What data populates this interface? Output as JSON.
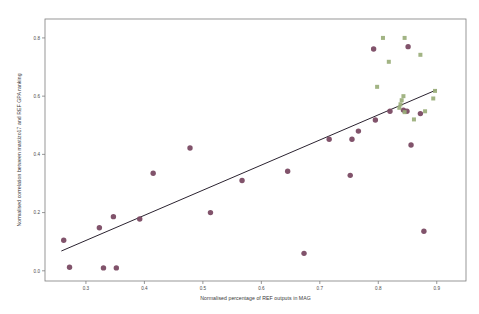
{
  "chart_data": {
    "type": "scatter",
    "title": "",
    "xlabel": "Normalised percentage of REF outputs in MAG",
    "ylabel": "Normalised correlation between mastizo17 and REF GPA ranking",
    "xlim": [
      0.23,
      0.95
    ],
    "ylim": [
      -0.035,
      0.865
    ],
    "xticks": [
      0.3,
      0.4,
      0.5,
      0.6,
      0.7,
      0.8,
      0.9
    ],
    "xtick_labels": [
      "0.3",
      "0.4",
      "0.5",
      "0.6",
      "0.7",
      "0.8",
      "0.9"
    ],
    "yticks": [
      0.0,
      0.2,
      0.4,
      0.6,
      0.8
    ],
    "ytick_labels": [
      "0.0",
      "0.2",
      "0.4",
      "0.6",
      "0.8"
    ],
    "grid": false,
    "legend_position": "none",
    "colors": {
      "series_primary": "#7a4a63",
      "series_secondary": "#9aae7a",
      "fit_line": "#2b2330",
      "axis": "#7d7d7d",
      "text": "#3a3a3a",
      "background": "#ffffff"
    },
    "series": [
      {
        "name": "Units of assessment",
        "marker": "circle",
        "color": "#7a4a63",
        "points": [
          [
            0.262,
            0.105
          ],
          [
            0.272,
            0.012
          ],
          [
            0.323,
            0.148
          ],
          [
            0.33,
            0.01
          ],
          [
            0.347,
            0.186
          ],
          [
            0.352,
            0.01
          ],
          [
            0.392,
            0.178
          ],
          [
            0.415,
            0.335
          ],
          [
            0.478,
            0.422
          ],
          [
            0.513,
            0.2
          ],
          [
            0.567,
            0.31
          ],
          [
            0.645,
            0.342
          ],
          [
            0.673,
            0.06
          ],
          [
            0.716,
            0.452
          ],
          [
            0.755,
            0.452
          ],
          [
            0.752,
            0.328
          ],
          [
            0.766,
            0.48
          ],
          [
            0.792,
            0.762
          ],
          [
            0.795,
            0.518
          ],
          [
            0.82,
            0.548
          ],
          [
            0.851,
            0.77
          ],
          [
            0.843,
            0.552
          ],
          [
            0.849,
            0.548
          ],
          [
            0.856,
            0.432
          ],
          [
            0.872,
            0.54
          ],
          [
            0.878,
            0.136
          ]
        ]
      },
      {
        "name": "Overlapping institutions",
        "marker": "square",
        "color": "#9aae7a",
        "points": [
          [
            0.808,
            0.8
          ],
          [
            0.845,
            0.8
          ],
          [
            0.818,
            0.718
          ],
          [
            0.872,
            0.742
          ],
          [
            0.798,
            0.632
          ],
          [
            0.843,
            0.6
          ],
          [
            0.84,
            0.586
          ],
          [
            0.838,
            0.572
          ],
          [
            0.836,
            0.56
          ],
          [
            0.845,
            0.545
          ],
          [
            0.88,
            0.548
          ],
          [
            0.861,
            0.52
          ],
          [
            0.897,
            0.618
          ],
          [
            0.894,
            0.592
          ]
        ]
      }
    ],
    "fit_line": {
      "name": "linear-fit",
      "x_start": 0.258,
      "y_start": 0.068,
      "x_end": 0.9,
      "y_end": 0.622,
      "color": "#2b2330"
    }
  }
}
